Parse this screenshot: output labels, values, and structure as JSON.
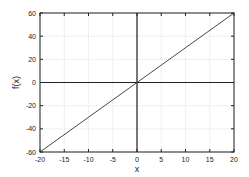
{
  "chart_data": {
    "type": "line",
    "title": "",
    "xlabel": "x",
    "ylabel": "f(x)",
    "xlim": [
      -20,
      20
    ],
    "ylim": [
      -60,
      60
    ],
    "grid": true,
    "legend": null,
    "x_ticks": [
      -20,
      -15,
      -10,
      -5,
      0,
      5,
      10,
      15,
      20
    ],
    "y_ticks": [
      -60,
      -40,
      -20,
      0,
      20,
      40,
      60
    ],
    "x_tick_labels": [
      "-20",
      "-15",
      "-10",
      "-5",
      "0",
      "5",
      "10",
      "15",
      "20"
    ],
    "y_tick_labels": [
      "-60",
      "-40",
      "-20",
      "0",
      "20",
      "40",
      "60"
    ],
    "series": [
      {
        "name": "f(x)",
        "x": [
          -20,
          20
        ],
        "y": [
          -60,
          60
        ],
        "color": "#333333"
      }
    ]
  },
  "labels": {
    "xlabel": "x",
    "ylabel": "f(x)"
  }
}
